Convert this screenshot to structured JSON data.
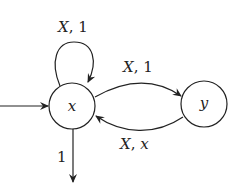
{
  "diagram": {
    "type": "state-machine",
    "nodes": [
      {
        "id": "x",
        "label": "x",
        "cx": 72,
        "cy": 106,
        "r": 23,
        "initial": true
      },
      {
        "id": "y",
        "label": "y",
        "cx": 204,
        "cy": 104,
        "r": 23,
        "initial": false
      }
    ],
    "edges": [
      {
        "from": "x",
        "to": "x",
        "label": "X, 1",
        "label_input": "X",
        "label_output": "1",
        "kind": "self-loop"
      },
      {
        "from": "x",
        "to": "y",
        "label": "X, 1",
        "label_input": "X",
        "label_output": "1",
        "kind": "curve-upper"
      },
      {
        "from": "y",
        "to": "x",
        "label": "X, x",
        "label_input": "X",
        "label_output": "x",
        "kind": "curve-lower"
      },
      {
        "from": "x",
        "to": "output",
        "label": "1",
        "kind": "final-out"
      }
    ],
    "initial_arrow": {
      "to": "x"
    },
    "colors": {
      "stroke": "#222222",
      "background": "#ffffff"
    }
  }
}
